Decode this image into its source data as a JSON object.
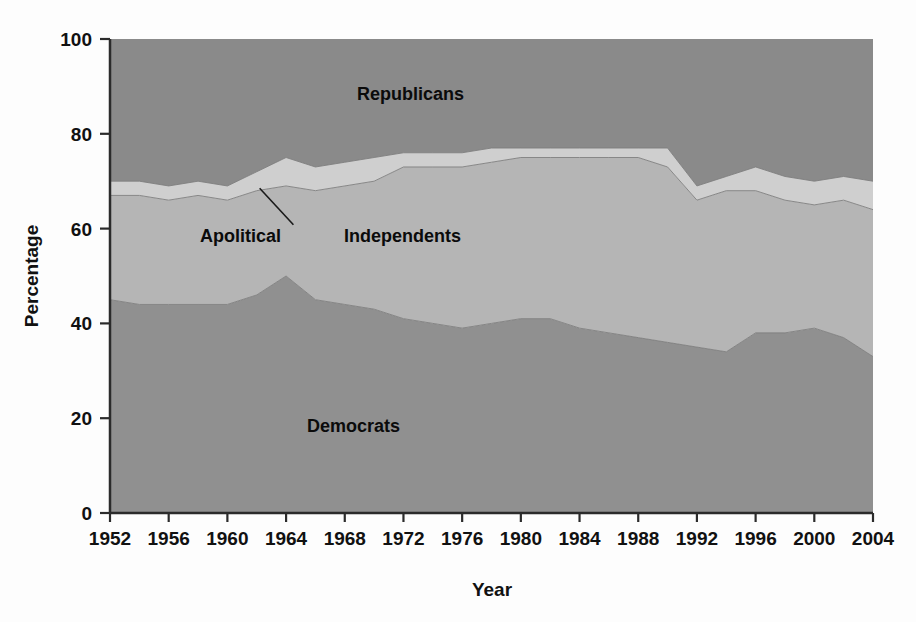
{
  "figure": {
    "background_color": "#fdfdfd",
    "plot_border_color": "#2b2b2b"
  },
  "chart_data": {
    "type": "area",
    "stacked": true,
    "title": "",
    "subtitle": "",
    "xlabel": "Year",
    "ylabel": "Percentage",
    "xlim": [
      1952,
      2004
    ],
    "ylim": [
      0,
      100
    ],
    "grid": false,
    "legend_position": "inline-annotations",
    "x_tick_labels": [
      "1952",
      "1956",
      "1960",
      "1964",
      "1968",
      "1972",
      "1976",
      "1980",
      "1984",
      "1988",
      "1992",
      "1996",
      "2000",
      "2004"
    ],
    "y_tick_labels": [
      "0",
      "20",
      "40",
      "60",
      "80",
      "100"
    ],
    "x_ticks": [
      1952,
      1956,
      1960,
      1964,
      1968,
      1972,
      1976,
      1980,
      1984,
      1988,
      1992,
      1996,
      2000,
      2004
    ],
    "y_ticks": [
      0,
      20,
      40,
      60,
      80,
      100
    ],
    "x": [
      1952,
      1954,
      1956,
      1958,
      1960,
      1962,
      1964,
      1966,
      1968,
      1970,
      1972,
      1974,
      1976,
      1978,
      1980,
      1982,
      1984,
      1986,
      1988,
      1990,
      1992,
      1994,
      1996,
      1998,
      2000,
      2002,
      2004
    ],
    "series": [
      {
        "name": "Democrats",
        "color": "#909090",
        "label_text": "Democrats",
        "values": [
          45,
          44,
          44,
          44,
          44,
          46,
          50,
          45,
          44,
          43,
          41,
          40,
          39,
          40,
          41,
          41,
          39,
          38,
          37,
          36,
          35,
          34,
          38,
          38,
          39,
          37,
          33
        ]
      },
      {
        "name": "Independents",
        "color": "#b5b5b5",
        "label_text": "Independents",
        "values": [
          22,
          23,
          22,
          23,
          22,
          22,
          19,
          23,
          25,
          27,
          32,
          33,
          34,
          34,
          34,
          34,
          36,
          37,
          38,
          37,
          31,
          34,
          30,
          28,
          26,
          29,
          31
        ]
      },
      {
        "name": "Apolitical",
        "color": "#cfcfcf",
        "label_text": "Apolitical",
        "values": [
          3,
          3,
          3,
          3,
          3,
          4,
          6,
          5,
          5,
          5,
          3,
          3,
          3,
          3,
          2,
          2,
          2,
          2,
          2,
          4,
          3,
          3,
          5,
          5,
          5,
          5,
          6
        ]
      },
      {
        "name": "Republicans",
        "color": "#8a8a8a",
        "label_text": "Republicans",
        "values": [
          30,
          30,
          31,
          30,
          31,
          28,
          25,
          27,
          26,
          25,
          24,
          24,
          24,
          23,
          23,
          23,
          23,
          23,
          23,
          23,
          31,
          29,
          27,
          29,
          30,
          29,
          30
        ]
      }
    ],
    "annotations": [
      {
        "name": "apolitical-leader-line",
        "text": "",
        "from_x": 1962.2,
        "from_y": 68.5,
        "to_x": 1964.5,
        "to_y": 60.8
      }
    ]
  },
  "labels": {
    "republicans": "Republicans",
    "independents": "Independents",
    "apolitical": "Apolitical",
    "democrats": "Democrats",
    "y_axis_title": "Percentage",
    "x_axis_title": "Year"
  }
}
